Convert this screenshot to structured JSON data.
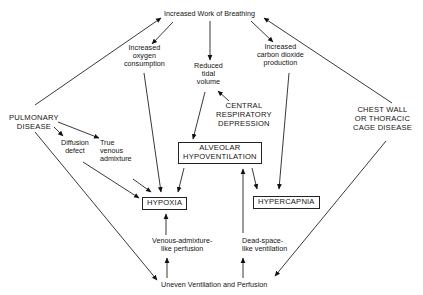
{
  "nodes": {
    "work_of_breathing": "Increased Work of Breathing",
    "oxygen_consumption": [
      "Increased",
      "oxygen",
      "consumption"
    ],
    "reduced_tidal_volume": [
      "Reduced",
      "tidal",
      "volume"
    ],
    "co2_production": [
      "Increased",
      "carbon dioxide",
      "production"
    ],
    "central_depression": [
      "CENTRAL",
      "RESPIRATORY",
      "DEPRESSION"
    ],
    "pulmonary_disease": [
      "PULMONARY",
      "DISEASE"
    ],
    "diffusion_defect": [
      "Diffusion",
      "defect"
    ],
    "true_venous_admixture": [
      "True",
      "venous",
      "admixture"
    ],
    "alveolar_hypoventilation": [
      "ALVEOLAR",
      "HYPOVENTILATION"
    ],
    "chest_wall_disease": [
      "CHEST WALL",
      "OR THORACIC",
      "CAGE DISEASE"
    ],
    "hypoxia": "HYPOXIA",
    "hypercapnia": "HYPERCAPNIA",
    "venous_admixture_like": [
      "Venous-admixture-",
      "like perfusion"
    ],
    "dead_space_like": [
      "Dead-space-",
      "like ventilation"
    ],
    "uneven_vq": "Uneven Ventilation and Perfusion"
  },
  "edges": [
    {
      "from": "pulmonary_disease",
      "to": "work_of_breathing"
    },
    {
      "from": "chest_wall_disease",
      "to": "work_of_breathing"
    },
    {
      "from": "work_of_breathing",
      "to": "oxygen_consumption"
    },
    {
      "from": "work_of_breathing",
      "to": "reduced_tidal_volume"
    },
    {
      "from": "work_of_breathing",
      "to": "co2_production"
    },
    {
      "from": "central_depression",
      "to": "reduced_tidal_volume"
    },
    {
      "from": "reduced_tidal_volume",
      "to": "alveolar_hypoventilation"
    },
    {
      "from": "pulmonary_disease",
      "to": "diffusion_defect"
    },
    {
      "from": "pulmonary_disease",
      "to": "true_venous_admixture"
    },
    {
      "from": "pulmonary_disease",
      "to": "uneven_vq"
    },
    {
      "from": "chest_wall_disease",
      "to": "uneven_vq"
    },
    {
      "from": "diffusion_defect",
      "to": "hypoxia"
    },
    {
      "from": "true_venous_admixture",
      "to": "hypoxia"
    },
    {
      "from": "oxygen_consumption",
      "to": "hypoxia"
    },
    {
      "from": "alveolar_hypoventilation",
      "to": "hypoxia"
    },
    {
      "from": "alveolar_hypoventilation",
      "to": "hypercapnia"
    },
    {
      "from": "co2_production",
      "to": "hypercapnia"
    },
    {
      "from": "venous_admixture_like",
      "to": "hypoxia"
    },
    {
      "from": "dead_space_like",
      "to": "alveolar_hypoventilation"
    },
    {
      "from": "uneven_vq",
      "to": "venous_admixture_like"
    },
    {
      "from": "uneven_vq",
      "to": "dead_space_like"
    }
  ]
}
